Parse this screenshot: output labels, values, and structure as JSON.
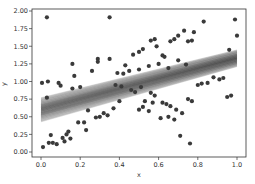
{
  "chart_data": {
    "type": "scatter",
    "title": "",
    "xlabel": "x",
    "ylabel": "y",
    "xlim": [
      -0.05,
      1.05
    ],
    "ylim": [
      -0.02,
      2.05
    ],
    "grid": false,
    "legend": null,
    "x_ticks": [
      "0.0",
      "0.2",
      "0.4",
      "0.6",
      "0.8",
      "1.0"
    ],
    "x_tick_values": [
      0.0,
      0.2,
      0.4,
      0.6,
      0.8,
      1.0
    ],
    "y_ticks": [
      "0.00",
      "0.25",
      "0.50",
      "0.75",
      "1.00",
      "1.25",
      "1.50",
      "1.75",
      "2.00"
    ],
    "y_tick_values": [
      0.0,
      0.25,
      0.5,
      0.75,
      1.0,
      1.25,
      1.5,
      1.75,
      2.0
    ],
    "series": [
      {
        "name": "observations",
        "kind": "scatter",
        "color": "#3a3a3a",
        "points": [
          [
            0.03,
            1.91
          ],
          [
            0.35,
            1.91
          ],
          [
            0.005,
            0.98
          ],
          [
            0.035,
            1.0
          ],
          [
            0.09,
            0.98
          ],
          [
            0.1,
            0.94
          ],
          [
            0.16,
            1.25
          ],
          [
            0.17,
            1.08
          ],
          [
            0.26,
            1.15
          ],
          [
            0.29,
            1.32
          ],
          [
            0.29,
            1.28
          ],
          [
            0.35,
            1.32
          ],
          [
            0.39,
            1.12
          ],
          [
            0.42,
            1.11
          ],
          [
            0.43,
            1.23
          ],
          [
            0.03,
            0.77
          ],
          [
            0.16,
            0.9
          ],
          [
            0.2,
            0.92
          ],
          [
            0.38,
            0.95
          ],
          [
            0.41,
            0.93
          ],
          [
            0.01,
            0.07
          ],
          [
            0.04,
            0.13
          ],
          [
            0.05,
            0.24
          ],
          [
            0.06,
            0.13
          ],
          [
            0.08,
            0.11
          ],
          [
            0.11,
            0.2
          ],
          [
            0.12,
            0.15
          ],
          [
            0.13,
            0.25
          ],
          [
            0.14,
            0.29
          ],
          [
            0.15,
            0.19
          ],
          [
            0.19,
            0.42
          ],
          [
            0.22,
            0.42
          ],
          [
            0.23,
            0.31
          ],
          [
            0.24,
            0.59
          ],
          [
            0.28,
            0.49
          ],
          [
            0.3,
            0.5
          ],
          [
            0.32,
            0.55
          ],
          [
            0.34,
            0.52
          ],
          [
            0.37,
            0.62
          ],
          [
            0.4,
            0.72
          ],
          [
            0.47,
            1.38
          ],
          [
            0.5,
            1.42
          ],
          [
            0.52,
            1.46
          ],
          [
            0.56,
            1.58
          ],
          [
            0.58,
            1.6
          ],
          [
            0.59,
            1.5
          ],
          [
            0.62,
            1.37
          ],
          [
            0.63,
            1.35
          ],
          [
            0.66,
            1.57
          ],
          [
            0.68,
            1.6
          ],
          [
            0.7,
            1.65
          ],
          [
            0.73,
            1.72
          ],
          [
            0.75,
            1.57
          ],
          [
            0.77,
            1.58
          ],
          [
            0.78,
            1.7
          ],
          [
            0.83,
            1.85
          ],
          [
            0.99,
            1.88
          ],
          [
            1.0,
            1.65
          ],
          [
            0.96,
            1.45
          ],
          [
            0.45,
            1.15
          ],
          [
            0.5,
            1.17
          ],
          [
            0.55,
            1.22
          ],
          [
            0.6,
            1.25
          ],
          [
            0.65,
            1.19
          ],
          [
            0.7,
            1.3
          ],
          [
            0.74,
            1.24
          ],
          [
            0.46,
            0.88
          ],
          [
            0.48,
            0.85
          ],
          [
            0.51,
            0.92
          ],
          [
            0.56,
            0.84
          ],
          [
            0.58,
            0.8
          ],
          [
            0.62,
            0.7
          ],
          [
            0.64,
            0.68
          ],
          [
            0.66,
            0.65
          ],
          [
            0.69,
            0.6
          ],
          [
            0.72,
            0.55
          ],
          [
            0.75,
            0.75
          ],
          [
            0.77,
            0.72
          ],
          [
            0.8,
            0.95
          ],
          [
            0.82,
            0.97
          ],
          [
            0.85,
            0.98
          ],
          [
            0.88,
            1.06
          ],
          [
            0.91,
            1.03
          ],
          [
            0.93,
            1.05
          ],
          [
            0.95,
            0.78
          ],
          [
            0.97,
            0.8
          ],
          [
            0.5,
            0.6
          ],
          [
            0.52,
            0.64
          ],
          [
            0.55,
            0.58
          ],
          [
            0.61,
            0.48
          ],
          [
            0.65,
            0.5
          ],
          [
            0.68,
            0.46
          ],
          [
            0.71,
            0.23
          ],
          [
            0.76,
            0.12
          ],
          [
            0.53,
            0.72
          ],
          [
            0.57,
            0.7
          ]
        ]
      },
      {
        "name": "posterior regression lines",
        "kind": "band",
        "color": "#555555",
        "x": [
          0.0,
          1.0
        ],
        "lower": [
          0.43,
          1.2
        ],
        "upper": [
          0.77,
          1.46
        ],
        "mean": [
          0.6,
          1.33
        ]
      }
    ]
  }
}
